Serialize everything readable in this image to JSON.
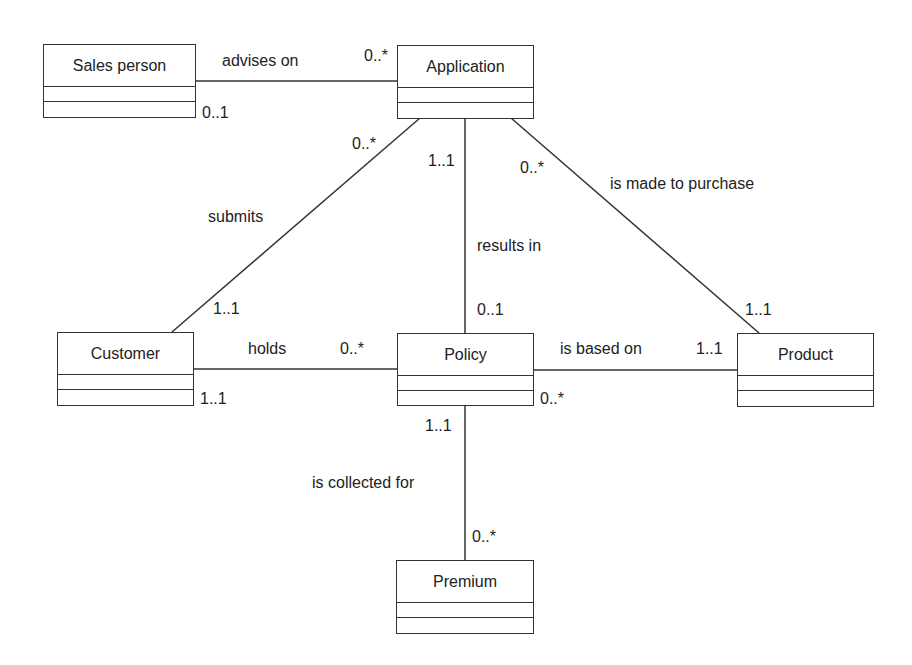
{
  "classes": {
    "sales_person": {
      "name": "Sales person"
    },
    "application": {
      "name": "Application"
    },
    "customer": {
      "name": "Customer"
    },
    "policy": {
      "name": "Policy"
    },
    "product": {
      "name": "Product"
    },
    "premium": {
      "name": "Premium"
    }
  },
  "associations": {
    "advises_on": {
      "label": "advises on",
      "source_mult": "0..1",
      "target_mult": "0..*"
    },
    "submits": {
      "label": "submits",
      "source_mult": "1..1",
      "target_mult": "0..*"
    },
    "results_in": {
      "label": "results in",
      "source_mult": "1..1",
      "target_mult": "0..1"
    },
    "is_made_to_purchase": {
      "label": "is made to purchase",
      "source_mult": "0..*",
      "target_mult": "1..1"
    },
    "holds": {
      "label": "holds",
      "source_mult": "1..1",
      "target_mult": "0..*"
    },
    "is_based_on": {
      "label": "is based on",
      "source_mult": "0..*",
      "target_mult": "1..1"
    },
    "is_collected_for": {
      "label": "is collected for",
      "source_mult": "1..1",
      "target_mult": "0..*"
    }
  }
}
